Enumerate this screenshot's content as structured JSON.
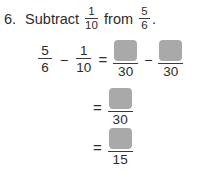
{
  "problem": {
    "number_label": "6.",
    "instruction_prefix": "Subtract",
    "instruction_middle": "from",
    "instruction_suffix": ".",
    "subtrahend": {
      "numerator": "1",
      "denominator": "10"
    },
    "minuend": {
      "numerator": "5",
      "denominator": "6"
    }
  },
  "operators": {
    "equals": "=",
    "minus": "−"
  },
  "work": {
    "rows": [
      {
        "left_fraction": {
          "numerator": "5",
          "denominator": "6"
        },
        "right_fraction": {
          "numerator": "1",
          "denominator": "10"
        },
        "result_terms": [
          {
            "numerator_box": "",
            "denominator": "30"
          },
          {
            "numerator_box": "",
            "denominator": "30"
          }
        ]
      },
      {
        "result_terms": [
          {
            "numerator_box": "",
            "denominator": "30"
          }
        ]
      },
      {
        "result_terms": [
          {
            "numerator_box": "",
            "denominator": "15"
          }
        ]
      }
    ]
  },
  "style": {
    "background": "#ffffff",
    "text_color": "#2b2b2b",
    "answer_box_fill": "#a9a9a9",
    "rule_color": "#3a3a3a"
  }
}
